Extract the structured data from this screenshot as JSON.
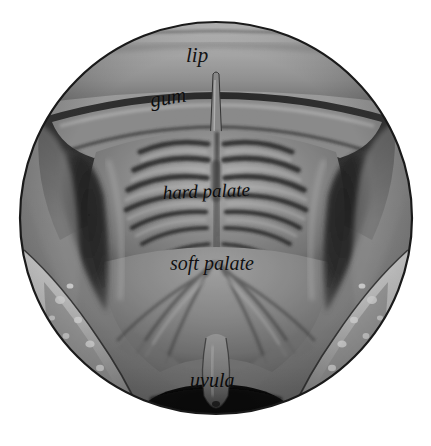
{
  "figure": {
    "kind": "anatomical-illustration",
    "rendering": "grayscale halftone engraving",
    "frame_shape": "circle",
    "background_color": "#ffffff",
    "outline_color": "#1a1a1a",
    "circle": {
      "center_x": 216,
      "center_y": 218,
      "radius": 197
    },
    "labels": [
      {
        "id": "lip",
        "text": "lip",
        "x": 186,
        "y": 45,
        "style": "italic-serif",
        "color": "#131313"
      },
      {
        "id": "gum",
        "text": "gum",
        "x": 152,
        "y": 90,
        "style": "italic-serif",
        "color": "#0d0d0d"
      },
      {
        "id": "hard-palate",
        "text": "hard palate",
        "x": 163,
        "y": 183,
        "style": "italic-serif",
        "color": "#0c0c0c"
      },
      {
        "id": "soft-palate",
        "text": "soft palate",
        "x": 170,
        "y": 253,
        "style": "italic-serif",
        "color": "#101010"
      },
      {
        "id": "uvula",
        "text": "uvula",
        "x": 190,
        "y": 370,
        "style": "italic-serif",
        "color": "#0b0b0b"
      }
    ],
    "regions": [
      {
        "id": "upper-lip",
        "name": "upper lip",
        "tone": "#b9b9b9"
      },
      {
        "id": "upper-gum",
        "name": "upper gum / alveolar ridge",
        "tone": "#8e8e8e"
      },
      {
        "id": "hard-palate-area",
        "name": "hard palate with rugae",
        "tone": "#9a9a9a"
      },
      {
        "id": "soft-palate-area",
        "name": "soft palate",
        "tone": "#8a8a8a"
      },
      {
        "id": "uvula-body",
        "name": "uvula",
        "tone": "#6f6f6f"
      },
      {
        "id": "oropharynx",
        "name": "throat opening",
        "tone": "#141414"
      },
      {
        "id": "left-cheek",
        "name": "left cheek / lower lip",
        "tone": "#d2d2d2"
      },
      {
        "id": "right-cheek",
        "name": "right cheek / lower lip",
        "tone": "#d2d2d2"
      }
    ]
  }
}
